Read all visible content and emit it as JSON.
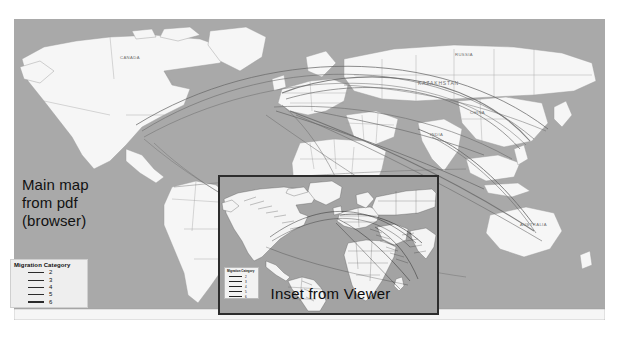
{
  "figure": {
    "kind": "world-migration-flow-map",
    "ocean_color": "#a9a9a9",
    "land_color": "#f6f6f6",
    "border_color": "#9a9a9a",
    "flow_line_color": "#6e6e6e",
    "inset_border_color": "#2d2d2d",
    "inset_ocean_color": "#a3a3a3"
  },
  "annotations": {
    "main_line1": "Main map",
    "main_line2": "from pdf",
    "main_line3": "(browser)",
    "inset_caption": "Inset from Viewer"
  },
  "legend_main": {
    "title": "Migration Category",
    "entries": [
      {
        "label": "2",
        "width_px": 0.8
      },
      {
        "label": "3",
        "width_px": 1.1
      },
      {
        "label": "4",
        "width_px": 1.4
      },
      {
        "label": "5",
        "width_px": 1.8
      },
      {
        "label": "6",
        "width_px": 2.3
      }
    ]
  },
  "legend_inset": {
    "title": "Migration Category",
    "entries": [
      {
        "label": "2",
        "width_px": 0.5
      },
      {
        "label": "3",
        "width_px": 0.7
      },
      {
        "label": "4",
        "width_px": 0.9
      },
      {
        "label": "5",
        "width_px": 1.2
      },
      {
        "label": "6",
        "width_px": 1.5
      }
    ]
  },
  "map_labels": [
    {
      "name": "KAZAKHSTAN",
      "x": 418,
      "y": 80
    },
    {
      "name": "RUSSIA",
      "x": 455,
      "y": 52
    },
    {
      "name": "CHINA",
      "x": 470,
      "y": 110
    },
    {
      "name": "INDIA",
      "x": 430,
      "y": 132
    },
    {
      "name": "AUSTRALIA",
      "x": 520,
      "y": 222
    },
    {
      "name": "BRAZIL",
      "x": 230,
      "y": 205
    },
    {
      "name": "CANADA",
      "x": 120,
      "y": 55
    }
  ]
}
